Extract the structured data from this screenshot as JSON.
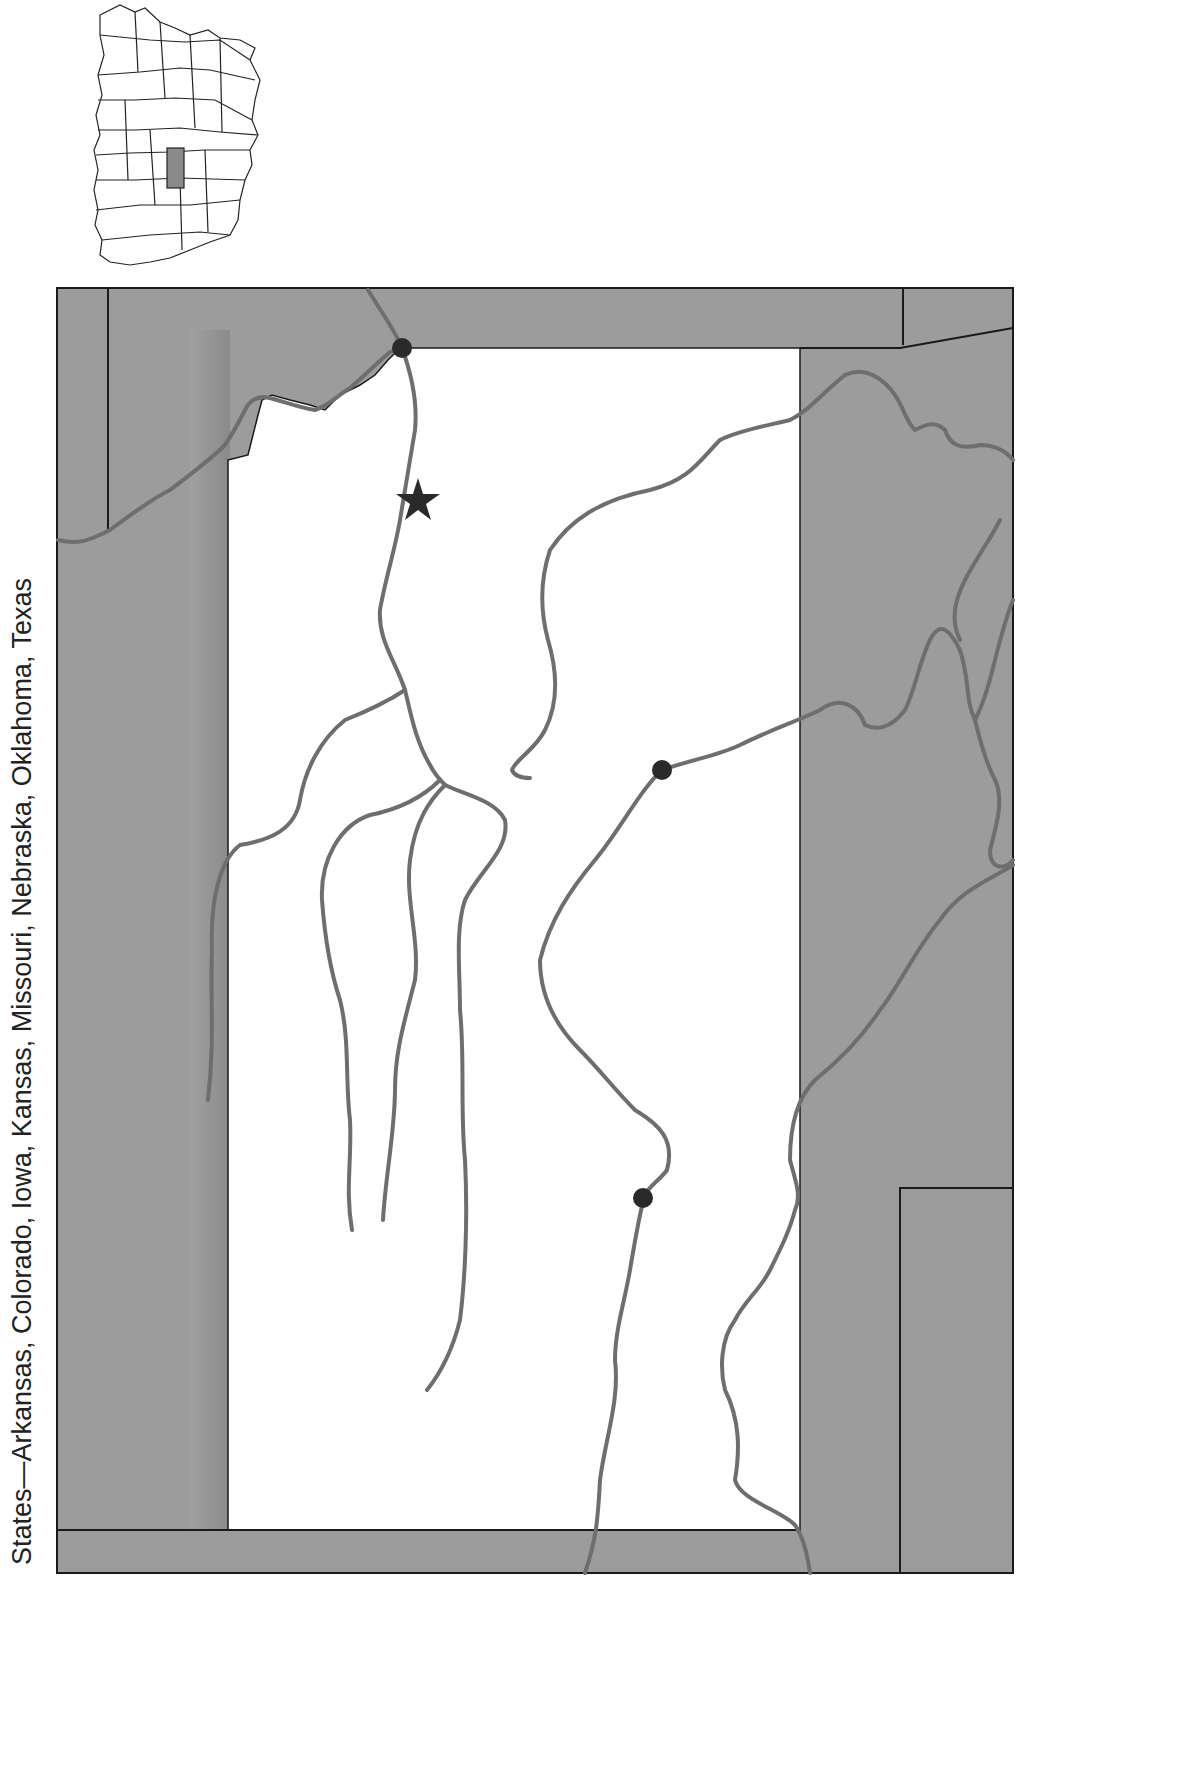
{
  "caption": {
    "text": "States—Arkansas, Colorado, Iowa, Kansas, Missouri, Nebraska, Oklahoma, Texas"
  },
  "inset_map": {
    "label": "US locator map",
    "highlighted_state_color": "#8a8a8a",
    "outline_color": "#222222"
  },
  "main_map": {
    "surrounding_fill": "#9a9a9a",
    "focus_state_fill": "#ffffff",
    "river_color": "#6e6e6e",
    "border_color": "#1a1a1a",
    "markers": [
      {
        "type": "dot",
        "label": "city-dot-north"
      },
      {
        "type": "star",
        "label": "capital-star"
      },
      {
        "type": "dot",
        "label": "city-dot-east"
      },
      {
        "type": "dot",
        "label": "city-dot-south"
      }
    ]
  }
}
